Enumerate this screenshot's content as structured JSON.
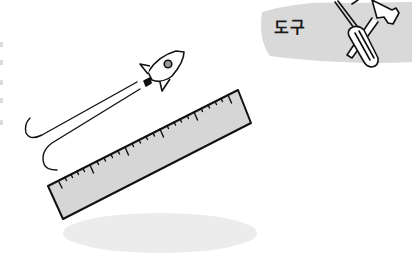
{
  "illustration": {
    "badge": {
      "label": "도구",
      "background_color": "#d9d9d9",
      "icon": "tools-icon",
      "tools": [
        "screwdriver",
        "hammer"
      ]
    },
    "rocket": {
      "icon": "rocket-icon",
      "window_color": "#9a9a9a",
      "trail": "double-curved-trail"
    },
    "ruler": {
      "icon": "ruler-icon",
      "fill_color": "#d6d6d6",
      "outline_color": "#111111"
    },
    "shadow": {
      "color": "#ececec"
    }
  }
}
